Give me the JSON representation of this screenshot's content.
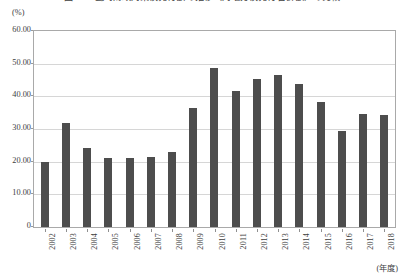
{
  "chart_data": {
    "type": "bar",
    "title": "図5-1　臨時財政対策債発行額の推移（対地方債発行合計額）の比較",
    "xlabel": "(年度)",
    "ylabel": "(%)",
    "categories": [
      "2002",
      "2003",
      "2004",
      "2005",
      "2006",
      "2007",
      "2008",
      "2009",
      "2010",
      "2011",
      "2012",
      "2013",
      "2014",
      "2015",
      "2016",
      "2017",
      "2018"
    ],
    "values": [
      20.0,
      31.7,
      24.3,
      21.0,
      21.0,
      21.3,
      23.0,
      36.4,
      48.6,
      41.6,
      45.4,
      46.6,
      43.7,
      38.3,
      29.4,
      34.6,
      34.3
    ],
    "ylim": [
      0,
      60
    ],
    "ytick_labels": [
      "0",
      "10.00",
      "20.00",
      "30.00",
      "40.00",
      "50.00",
      "60.00"
    ],
    "ytick_values": [
      0,
      10,
      20,
      30,
      40,
      50,
      60
    ],
    "grid": true,
    "legend": false,
    "bar_color": "#4d4d4d",
    "grid_color": "#d6d6d6",
    "frame_color": "#a9a9a9"
  }
}
